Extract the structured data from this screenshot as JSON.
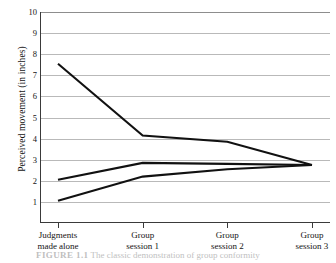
{
  "chart_data": {
    "type": "line",
    "title": "",
    "xlabel": "",
    "ylabel": "Perceived movement (in inches)",
    "categories": [
      "Judgments\nmade alone",
      "Group\nsession 1",
      "Group\nsession 2",
      "Group\nsession 3"
    ],
    "category_lines": [
      [
        "Judgments",
        "made alone"
      ],
      [
        "Group",
        "session 1"
      ],
      [
        "Group",
        "session 2"
      ],
      [
        "Group",
        "session 3"
      ]
    ],
    "yticks": [
      1,
      2,
      3,
      4,
      5,
      6,
      7,
      8,
      9,
      10
    ],
    "ytick_labels": [
      "1",
      "2",
      "3",
      "4",
      "5",
      "6",
      "7",
      "8",
      "9",
      "10"
    ],
    "ylim": [
      0,
      10
    ],
    "xlim": [
      0,
      3
    ],
    "grid": "horizontal",
    "legend": "none",
    "line_color": "#111111",
    "grid_color": "#b9b9b9",
    "axis_color": "#3a3a3a",
    "series": [
      {
        "name": "Participant 1",
        "values": [
          7.55,
          4.15,
          3.85,
          2.75
        ]
      },
      {
        "name": "Participant 2",
        "values": [
          2.05,
          2.85,
          2.8,
          2.75
        ]
      },
      {
        "name": "Participant 3",
        "values": [
          1.05,
          2.2,
          2.55,
          2.75
        ]
      }
    ]
  },
  "caption": {
    "label": "FIGURE 1.1",
    "text": "The classic demonstration of group conformity"
  }
}
